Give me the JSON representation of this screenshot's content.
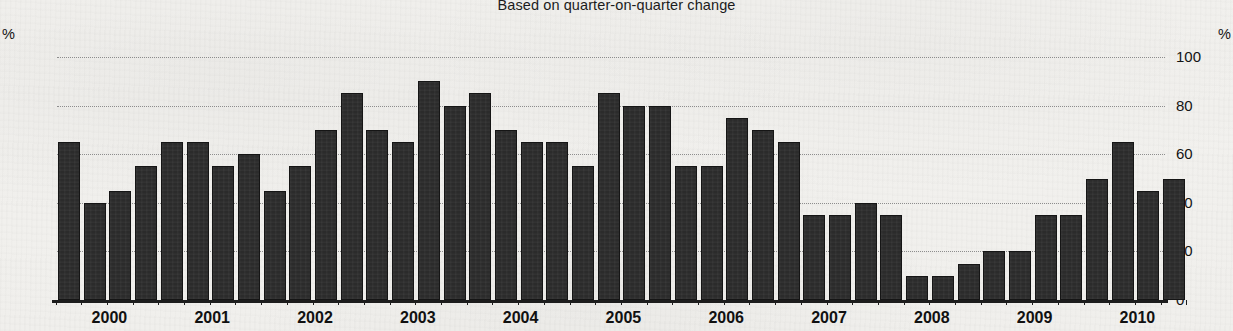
{
  "header": {
    "title_clipped": "Chart: proportion of firms reporting higher output",
    "subtitle": "Based on quarter-on-quarter change",
    "unit_left": "%",
    "unit_right": "%"
  },
  "axis": {
    "y_ticks": [
      0,
      20,
      40,
      60,
      80,
      100
    ],
    "y_tick_labels": [
      "0",
      "20",
      "40",
      "60",
      "80",
      "100"
    ],
    "x_year_labels": [
      "2000",
      "2001",
      "2002",
      "2003",
      "2004",
      "2005",
      "2006",
      "2007",
      "2008",
      "2009",
      "2010"
    ]
  },
  "style": {
    "bar_color": "#2b2b2b",
    "bar_edge_color": "#151515",
    "background": "#f2f1ee",
    "grid_color": "#8d8d8d",
    "text_color": "#141414"
  },
  "chart_data": {
    "type": "bar",
    "title": "Based on quarter-on-quarter change",
    "xlabel": "",
    "ylabel": "%",
    "ylim": [
      0,
      100
    ],
    "grid": true,
    "legend": "none",
    "categories": [
      "2000 Q1",
      "2000 Q2",
      "2000 Q3",
      "2000 Q4",
      "2001 Q1",
      "2001 Q2",
      "2001 Q3",
      "2001 Q4",
      "2002 Q1",
      "2002 Q2",
      "2002 Q3",
      "2002 Q4",
      "2003 Q1",
      "2003 Q2",
      "2003 Q3",
      "2003 Q4",
      "2004 Q1",
      "2004 Q2",
      "2004 Q3",
      "2004 Q4",
      "2005 Q1",
      "2005 Q2",
      "2005 Q3",
      "2005 Q4",
      "2006 Q1",
      "2006 Q2",
      "2006 Q3",
      "2006 Q4",
      "2007 Q1",
      "2007 Q2",
      "2007 Q3",
      "2007 Q4",
      "2008 Q1",
      "2008 Q2",
      "2008 Q3",
      "2008 Q4",
      "2009 Q1",
      "2009 Q2",
      "2009 Q3",
      "2009 Q4",
      "2010 Q1",
      "2010 Q2",
      "2010 Q3"
    ],
    "values": [
      65,
      40,
      45,
      55,
      65,
      65,
      55,
      60,
      45,
      55,
      70,
      85,
      70,
      65,
      90,
      80,
      85,
      70,
      65,
      65,
      55,
      85,
      80,
      80,
      55,
      55,
      75,
      70,
      65,
      35,
      35,
      40,
      35,
      10,
      10,
      15,
      20,
      20,
      35,
      35,
      50,
      65,
      45
    ],
    "year_tick_positions": [
      "2000",
      "2001",
      "2002",
      "2003",
      "2004",
      "2005",
      "2006",
      "2007",
      "2008",
      "2009",
      "2010"
    ],
    "extra_trailing_value": 50
  }
}
